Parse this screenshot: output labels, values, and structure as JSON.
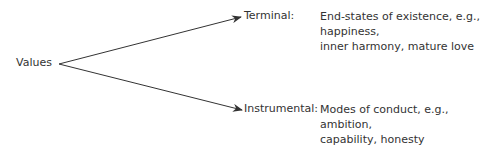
{
  "root": {
    "label": "Values"
  },
  "branches": [
    {
      "label": "Terminal:",
      "description_lines": [
        "End-states of existence, e.g.,",
        "happiness,",
        "inner harmony, mature love"
      ]
    },
    {
      "label": "Instrumental:",
      "description_lines": [
        "Modes of conduct, e.g.,",
        "ambition,",
        "capability, honesty"
      ]
    }
  ],
  "colors": {
    "line": "#333333",
    "text": "#333333"
  }
}
